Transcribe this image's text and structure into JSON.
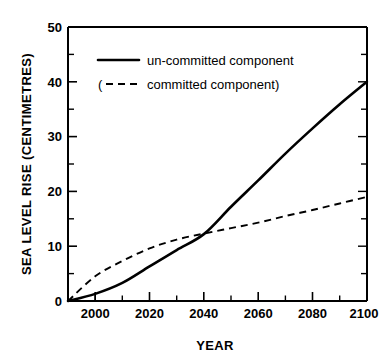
{
  "chart_data": {
    "type": "line",
    "title": "",
    "xlabel": "YEAR",
    "ylabel": "SEA LEVEL RISE (CENTIMETRES)",
    "xlim": [
      1990,
      2100
    ],
    "ylim": [
      0,
      50
    ],
    "x_ticks": [
      2000,
      2020,
      2040,
      2060,
      2080,
      2100
    ],
    "x_tick_labels": [
      "2000",
      "2020",
      "2040",
      "2060",
      "2080",
      "2100"
    ],
    "x_minor_step": 10,
    "y_ticks": [
      0,
      10,
      20,
      30,
      40,
      50
    ],
    "y_tick_labels": [
      "0",
      "10",
      "20",
      "30",
      "40",
      "50"
    ],
    "y_minor_step": 5,
    "grid": false,
    "legend_position": "upper-left",
    "x": [
      1990,
      2000,
      2010,
      2020,
      2030,
      2040,
      2050,
      2060,
      2070,
      2080,
      2090,
      2100
    ],
    "series": [
      {
        "name": "un-committed component",
        "style": "solid",
        "color": "#000000",
        "values": [
          0.0,
          1.3,
          3.3,
          6.3,
          9.3,
          12.2,
          17.2,
          22.0,
          26.9,
          31.5,
          35.9,
          40.0
        ]
      },
      {
        "name": "(committed component)",
        "style": "dashed",
        "color": "#000000",
        "values": [
          0.0,
          4.5,
          7.3,
          9.6,
          11.2,
          12.3,
          13.3,
          14.3,
          15.5,
          16.6,
          17.8,
          19.0
        ]
      }
    ]
  },
  "legend": {
    "entries": [
      {
        "label": "un-committed component",
        "style": "solid",
        "prefix": ""
      },
      {
        "label": "committed component)",
        "style": "dashed",
        "prefix": "("
      }
    ]
  },
  "axes": {
    "y_label": "SEA LEVEL RISE (CENTIMETRES)",
    "x_label": "YEAR",
    "y_tick_0": "0",
    "y_tick_1": "10",
    "y_tick_2": "20",
    "y_tick_3": "30",
    "y_tick_4": "40",
    "y_tick_5": "50",
    "x_tick_0": "2000",
    "x_tick_1": "2020",
    "x_tick_2": "2040",
    "x_tick_3": "2060",
    "x_tick_4": "2080",
    "x_tick_5": "2100"
  }
}
